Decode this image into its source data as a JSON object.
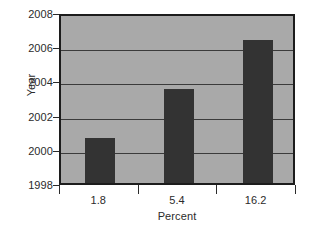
{
  "chart_data": {
    "type": "bar",
    "title": "",
    "subtitle": "",
    "xlabel": "Percent",
    "ylabel": "Year",
    "categories": [
      "1.8",
      "5.4",
      "16.2"
    ],
    "values": [
      2000.65,
      2003.5,
      2006.35
    ],
    "ylim": [
      1998,
      2008
    ],
    "yticks": [
      1998,
      2000,
      2002,
      2004,
      2006,
      2008
    ],
    "ytick_labels": [
      "1998",
      "2000",
      "2002",
      "2004",
      "2006",
      "2008"
    ],
    "gridlines": [
      2000,
      2002,
      2004,
      2006
    ],
    "grid": true,
    "legend": null,
    "legend_position": "none",
    "orientation": "vertical",
    "series": [
      {
        "name": "Year",
        "values": [
          2000.65,
          2003.5,
          2006.35
        ]
      }
    ],
    "colors": {
      "bar_fill": "#333333",
      "plot_background": "#a9a9a9",
      "frame": "#1c1c1c",
      "gridline": "#3b3b3b",
      "text": "#2b2b2b",
      "figure_background": "#ffffff"
    }
  }
}
